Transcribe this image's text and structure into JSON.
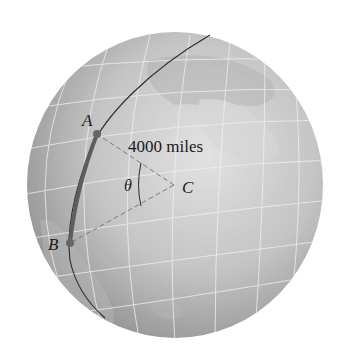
{
  "figure": {
    "points": {
      "A": {
        "label": "A",
        "x": 97,
        "y": 134
      },
      "B": {
        "label": "B",
        "x": 70,
        "y": 243
      },
      "C": {
        "label": "C",
        "x": 174,
        "y": 185
      }
    },
    "angle_label": "θ",
    "radius_label": "4000 miles",
    "colors": {
      "globe_light": "#d9d9d9",
      "globe_dark": "#8c8c8c",
      "grid": "#eeeeee",
      "great_circle": "#2b2b2b",
      "arc_highlight": "#5a5a5a",
      "dashed": "#777777",
      "point": "#666666"
    }
  }
}
